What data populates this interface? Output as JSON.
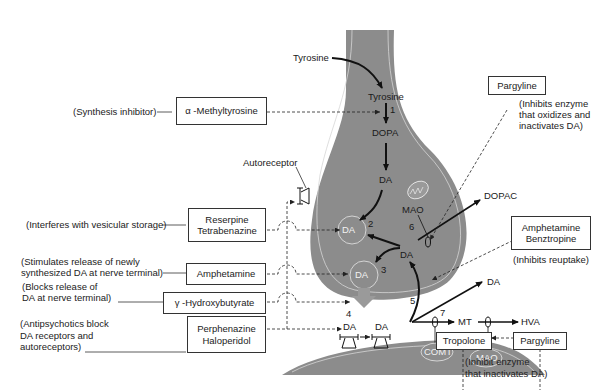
{
  "diagram": {
    "colors": {
      "neuron_fill": "#8c8c8c",
      "membrane_line": "#d9d9d9",
      "box_border": "#333333",
      "text": "#222222"
    },
    "pathway": {
      "tyrosine_outside": "Tyrosine",
      "tyrosine_inside": "Tyrosine",
      "dopa": "DOPA",
      "da_cytoplasm": "DA",
      "da_vesicle_storage": "DA",
      "da_vesicle_release": "DA",
      "da_reuptake": "DA",
      "da_released": "DA",
      "da_receptor_left": "DA",
      "da_receptor_right": "DA",
      "dopac": "DOPAC",
      "mao_mito": "MAO",
      "mt": "MT",
      "hva": "HVA",
      "comt": "COMT",
      "mao_post": "MAO",
      "autoreceptor": "Autoreceptor"
    },
    "step_numbers": [
      "1",
      "2",
      "3",
      "4",
      "5",
      "6",
      "7"
    ],
    "drugs": [
      {
        "name": "α -Methyltyrosine",
        "note": "(Synthesis inhibitor)"
      },
      {
        "name_line1": "Reserpine",
        "name_line2": "Tetrabenazine",
        "note": "(Interferes with vesicular storage)"
      },
      {
        "name": "Amphetamine",
        "note_line1": "(Stimulates release of newly",
        "note_line2": "synthesized DA at nerve terminal)"
      },
      {
        "name": "γ -Hydroxybutyrate",
        "note_line1": "(Blocks release of",
        "note_line2": "DA at nerve terminal)"
      },
      {
        "name_line1": "Perphenazine",
        "name_line2": "Haloperidol",
        "note_line1": "(Antipsychotics block",
        "note_line2": "DA receptors and",
        "note_line3": "autoreceptors)"
      },
      {
        "name": "Pargyline",
        "note_line1": "(Inhibits enzyme",
        "note_line2": "that oxidizes and",
        "note_line3": "inactivates DA)"
      },
      {
        "name_line1": "Amphetamine",
        "name_line2": "Benztropine",
        "note": "(Inhibits reuptake)"
      },
      {
        "name": "Tropolone"
      },
      {
        "name": "Pargyline"
      }
    ],
    "bottom_note": {
      "line1": "(Inhibit enzyme",
      "line2": "that inactivates DA)"
    }
  }
}
